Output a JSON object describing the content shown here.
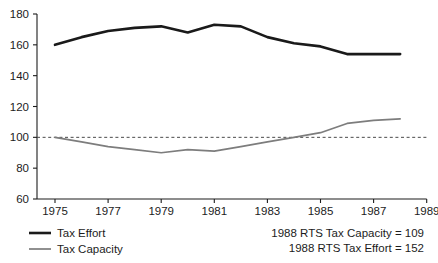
{
  "chart_data": {
    "type": "line",
    "title": "",
    "subtitle": "",
    "xlabel": "",
    "ylabel": "",
    "xlim": [
      1974,
      1989
    ],
    "ylim": [
      60,
      180
    ],
    "grid": false,
    "x": [
      1975,
      1976,
      1977,
      1978,
      1979,
      1980,
      1981,
      1982,
      1983,
      1984,
      1985,
      1986,
      1987,
      1988
    ],
    "xticks": [
      1975,
      1977,
      1979,
      1981,
      1983,
      1985,
      1987,
      1989
    ],
    "xtick_labels": [
      "1975",
      "1977",
      "1979",
      "1981",
      "1983",
      "1985",
      "1987",
      "1989"
    ],
    "yticks": [
      60,
      80,
      100,
      120,
      140,
      160,
      180
    ],
    "ytick_labels": [
      "60",
      "80",
      "100",
      "120",
      "140",
      "160",
      "180"
    ],
    "series": [
      {
        "name": "Tax Effort",
        "color": "#1a1a1a",
        "width": 2.6,
        "values": [
          160,
          165,
          169,
          171,
          172,
          168,
          173,
          172,
          165,
          161,
          159,
          154,
          154,
          154
        ]
      },
      {
        "name": "Tax Capacity",
        "color": "#7d7d7d",
        "width": 1.7,
        "values": [
          100,
          97,
          94,
          92,
          90,
          92,
          91,
          94,
          97,
          100,
          103,
          109,
          111,
          112
        ]
      }
    ],
    "reference_line": {
      "name": "index-100-reference",
      "value": 100,
      "style": "dashed",
      "color": "#4a4a4a"
    },
    "legend": {
      "position": "below-left",
      "entries": [
        {
          "label": "Tax Effort",
          "color": "#1a1a1a",
          "width": 2.6
        },
        {
          "label": "Tax Capacity",
          "color": "#7d7d7d",
          "width": 1.7
        }
      ]
    },
    "annotations": [
      {
        "text": "1988 RTS Tax Capacity = 109"
      },
      {
        "text": "1988 RTS Tax Effort = 152"
      }
    ]
  }
}
